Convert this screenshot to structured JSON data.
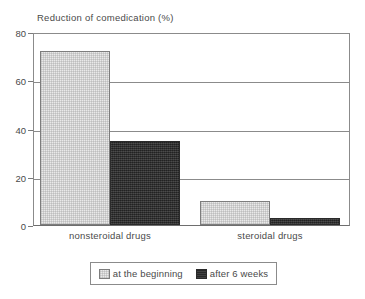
{
  "chart_data": {
    "type": "bar",
    "title": "Reduction of comedication (%)",
    "xlabel": "",
    "ylabel": "",
    "ylim": [
      0,
      80
    ],
    "yticks": [
      0,
      20,
      40,
      60,
      80
    ],
    "ytick_labels": [
      "0",
      "20",
      "40",
      "60",
      "80"
    ],
    "grid": true,
    "grid_axis": "y",
    "legend_position": "bottom",
    "categories": [
      "nonsteroidal drugs",
      "steroidal drugs"
    ],
    "series": [
      {
        "name": "at the beginning",
        "color": "#e9e9e9",
        "values": [
          73,
          10
        ]
      },
      {
        "name": "after 6 weeks",
        "color": "#333333",
        "values": [
          35,
          3
        ]
      }
    ]
  },
  "legend": {
    "entries": [
      {
        "label": "at the beginning"
      },
      {
        "label": "after 6 weeks"
      }
    ]
  }
}
